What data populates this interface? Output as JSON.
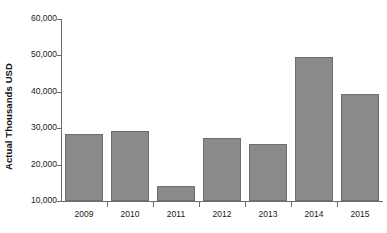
{
  "chart_data": {
    "type": "bar",
    "title": "",
    "subtitle": "",
    "xlabel": "",
    "ylabel": "Actual Thousands USD",
    "categories": [
      "2009",
      "2010",
      "2011",
      "2012",
      "2013",
      "2014",
      "2015"
    ],
    "values": [
      28500,
      29300,
      14000,
      27200,
      25700,
      49500,
      39500
    ],
    "ylim": [
      10000,
      60000
    ],
    "ytick_values": [
      10000,
      20000,
      30000,
      40000,
      50000,
      60000
    ],
    "ytick_labels": [
      "10,000",
      "20,000",
      "30,000",
      "40,000",
      "50,000",
      "60,000"
    ],
    "grid": false,
    "legend": false,
    "legend_position": "none",
    "annotations": [],
    "series": [
      {
        "name": "Actual Thousands USD",
        "values": [
          28500,
          29300,
          14000,
          27200,
          25700,
          49500,
          39500
        ]
      }
    ]
  },
  "style": {
    "bar_fill": "#8a8a8a",
    "bar_border": "#6e6e6e",
    "axis_color": "#6b6b6b",
    "text_color": "#1a1a1a",
    "background": "#ffffff"
  }
}
